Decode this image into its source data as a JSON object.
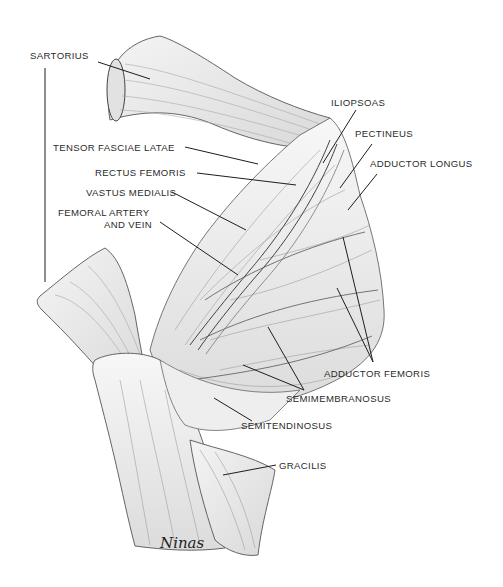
{
  "diagram": {
    "labels": [
      {
        "id": "sartorius",
        "text": "SARTORIUS"
      },
      {
        "id": "tensor_fasciae_latae",
        "text": "TENSOR FASCIAE LATAE"
      },
      {
        "id": "rectus_femoris",
        "text": "RECTUS FEMORIS"
      },
      {
        "id": "vastus_medialis",
        "text": "VASTUS MEDIALIS"
      },
      {
        "id": "femoral_artery_line1",
        "text": "FEMORAL ARTERY"
      },
      {
        "id": "femoral_artery_line2",
        "text": "AND VEIN"
      },
      {
        "id": "iliopsoas",
        "text": "ILIOPSOAS"
      },
      {
        "id": "pectineus",
        "text": "PECTINEUS"
      },
      {
        "id": "adductor_longus",
        "text": "ADDUCTOR LONGUS"
      },
      {
        "id": "adductor_femoris",
        "text": "ADDUCTOR FEMORIS"
      },
      {
        "id": "semimembranosus",
        "text": "SEMIMEMBRANOSUS"
      },
      {
        "id": "semitendinosus",
        "text": "SEMITENDINOSUS"
      },
      {
        "id": "gracilis",
        "text": "GRACILIS"
      }
    ],
    "signature": "NINAS",
    "colors": {
      "background": "#ffffff",
      "line": "#1e1e1e",
      "shading": "#9a9a9a",
      "text": "#2b2b2b"
    }
  }
}
